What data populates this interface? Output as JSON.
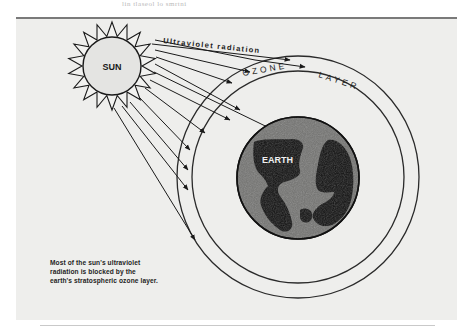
{
  "page": {
    "top_caption": "lin tlaseol lo smrtni"
  },
  "diagram": {
    "labels": {
      "sun": "SUN",
      "radiation": "Ultraviolet radiation",
      "ozone_word_1": "OZONE",
      "ozone_word_2": "LAYER",
      "earth": "EARTH"
    },
    "caption_lines": [
      "Most of the sun's ultraviolet",
      "radiation is blocked by the",
      "earth's stratospheric ozone layer."
    ],
    "arrow_count": 11,
    "colors": {
      "ink": "#1a1a1a",
      "paper": "#eeeeec",
      "sun_fill": "#e4e4e2",
      "earth_ocean": "#6f6f6f",
      "earth_land": "#0d0d0d"
    }
  }
}
